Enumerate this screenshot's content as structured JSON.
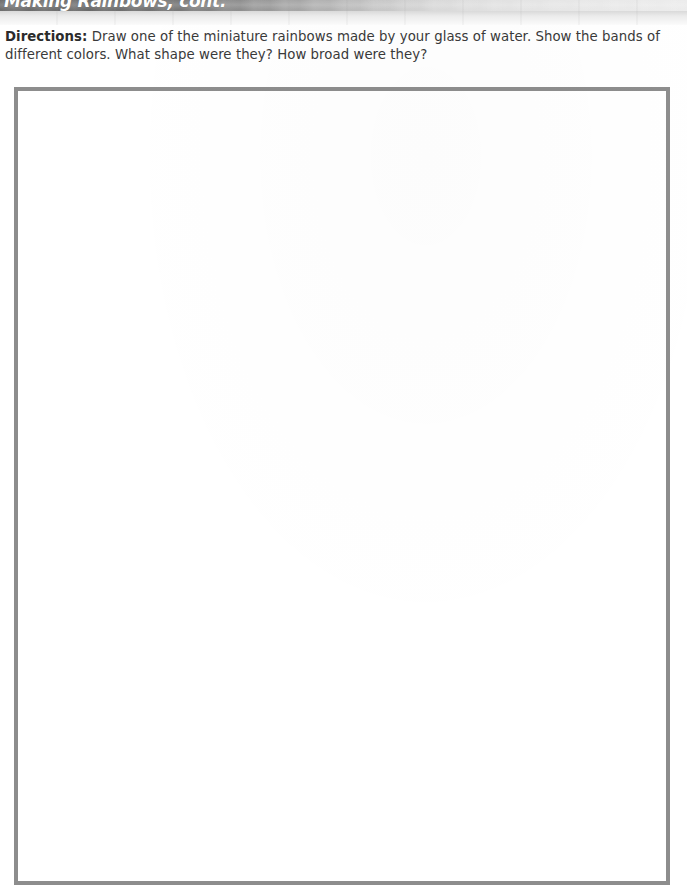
{
  "page": {
    "background_color": "#ffffff",
    "width": 687,
    "height": 844
  },
  "header": {
    "title": "Making Rainbows, cont.",
    "title_color": "#ffffff",
    "band_color_left": "#6e6e6e",
    "band_color_right": "#ececec",
    "note": "title is clipped by the top edge of the page"
  },
  "instructions": {
    "lead_label": "Directions:",
    "body": " Draw one of the miniature rainbows made by your glass of water. Show the bands of different colors. What shape were they? How broad were they?",
    "text_color": "#3a3a3a"
  },
  "drawing_area": {
    "label": "blank drawing box",
    "border_color": "#8d8d8d",
    "fill_color": "#ffffff",
    "content": ""
  }
}
